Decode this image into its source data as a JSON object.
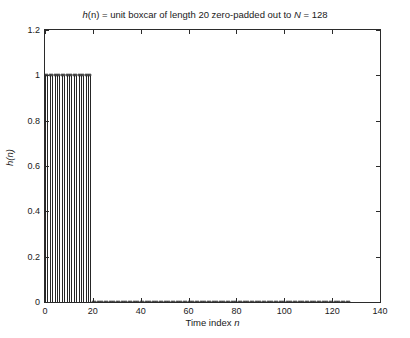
{
  "chart_data": {
    "type": "bar",
    "render_style": "stem",
    "title": "h(n) = unit boxcar of length 20 zero-padded out to N = 128",
    "title_parts": {
      "prefix_var": "h",
      "prefix_arg": "(n)",
      "text": " = unit boxcar of length 20 zero-padded out to ",
      "n_symbol": "N",
      "suffix": " = 128"
    },
    "xlabel": "Time index n",
    "xlabel_parts": {
      "text": "Time index ",
      "symbol": "n"
    },
    "ylabel": "h(n)",
    "xlim": [
      0,
      140
    ],
    "ylim": [
      0,
      1.2
    ],
    "xticks": [
      0,
      20,
      40,
      60,
      80,
      100,
      120,
      140
    ],
    "xticklabels": [
      "0",
      "20",
      "40",
      "60",
      "80",
      "100",
      "120",
      "140"
    ],
    "yticks": [
      0,
      0.2,
      0.4,
      0.6,
      0.8,
      1,
      1.2
    ],
    "yticklabels": [
      "0",
      "0.2",
      "0.4",
      "0.6",
      "0.8",
      "1",
      "1.2"
    ],
    "grid": false,
    "legend": false,
    "box": true,
    "tick_direction": "in",
    "line_color": "#262626",
    "marker": "circle",
    "n_points": 128,
    "boxcar_length": 20,
    "boxcar_value": 1,
    "pad_value": 0,
    "x": [
      0,
      1,
      2,
      3,
      4,
      5,
      6,
      7,
      8,
      9,
      10,
      11,
      12,
      13,
      14,
      15,
      16,
      17,
      18,
      19,
      20,
      21,
      22,
      23,
      24,
      25,
      26,
      27,
      28,
      29,
      30,
      31,
      32,
      33,
      34,
      35,
      36,
      37,
      38,
      39,
      40,
      41,
      42,
      43,
      44,
      45,
      46,
      47,
      48,
      49,
      50,
      51,
      52,
      53,
      54,
      55,
      56,
      57,
      58,
      59,
      60,
      61,
      62,
      63,
      64,
      65,
      66,
      67,
      68,
      69,
      70,
      71,
      72,
      73,
      74,
      75,
      76,
      77,
      78,
      79,
      80,
      81,
      82,
      83,
      84,
      85,
      86,
      87,
      88,
      89,
      90,
      91,
      92,
      93,
      94,
      95,
      96,
      97,
      98,
      99,
      100,
      101,
      102,
      103,
      104,
      105,
      106,
      107,
      108,
      109,
      110,
      111,
      112,
      113,
      114,
      115,
      116,
      117,
      118,
      119,
      120,
      121,
      122,
      123,
      124,
      125,
      126,
      127
    ],
    "values": [
      1,
      1,
      1,
      1,
      1,
      1,
      1,
      1,
      1,
      1,
      1,
      1,
      1,
      1,
      1,
      1,
      1,
      1,
      1,
      1,
      0,
      0,
      0,
      0,
      0,
      0,
      0,
      0,
      0,
      0,
      0,
      0,
      0,
      0,
      0,
      0,
      0,
      0,
      0,
      0,
      0,
      0,
      0,
      0,
      0,
      0,
      0,
      0,
      0,
      0,
      0,
      0,
      0,
      0,
      0,
      0,
      0,
      0,
      0,
      0,
      0,
      0,
      0,
      0,
      0,
      0,
      0,
      0,
      0,
      0,
      0,
      0,
      0,
      0,
      0,
      0,
      0,
      0,
      0,
      0,
      0,
      0,
      0,
      0,
      0,
      0,
      0,
      0,
      0,
      0,
      0,
      0,
      0,
      0,
      0,
      0,
      0,
      0,
      0,
      0,
      0,
      0,
      0,
      0,
      0,
      0,
      0,
      0,
      0,
      0,
      0,
      0,
      0,
      0,
      0,
      0,
      0,
      0,
      0,
      0,
      0,
      0,
      0,
      0,
      0,
      0,
      0,
      0
    ]
  }
}
